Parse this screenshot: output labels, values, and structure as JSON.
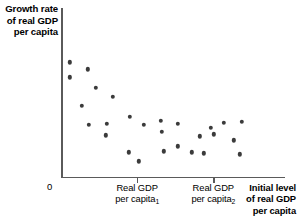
{
  "chart_data": {
    "type": "scatter",
    "title": "",
    "ylabel": "Growth rate of real GDP per capita",
    "xlabel": "Initial level of real GDP per capita",
    "grid": false,
    "legend": null,
    "origin_label": "0",
    "xlim": [
      0,
      1
    ],
    "ylim": [
      0,
      1
    ],
    "xticks": [
      {
        "value": 0.34,
        "label_line1": "Real GDP",
        "label_line2": "per capita",
        "label_sub": "1"
      },
      {
        "value": 0.68,
        "label_line1": "Real GDP",
        "label_line2": "per capita",
        "label_sub": "2"
      }
    ],
    "point_color": "#3b3b3b",
    "axis_color": "#5a5a5a",
    "points": [
      {
        "x": 0.0402,
        "y": 0.6784
      },
      {
        "x": 0.1205,
        "y": 0.6375
      },
      {
        "x": 0.0402,
        "y": 0.5906
      },
      {
        "x": 0.1563,
        "y": 0.5263
      },
      {
        "x": 0.2321,
        "y": 0.4737
      },
      {
        "x": 0.0938,
        "y": 0.4211
      },
      {
        "x": 0.308,
        "y": 0.3567
      },
      {
        "x": 0.2054,
        "y": 0.3158
      },
      {
        "x": 0.125,
        "y": 0.3099
      },
      {
        "x": 0.3705,
        "y": 0.3099
      },
      {
        "x": 0.2009,
        "y": 0.2456
      },
      {
        "x": 0.4464,
        "y": 0.3333
      },
      {
        "x": 0.4509,
        "y": 0.269
      },
      {
        "x": 0.3036,
        "y": 0.1462
      },
      {
        "x": 0.4598,
        "y": 0.152
      },
      {
        "x": 0.5223,
        "y": 0.1813
      },
      {
        "x": 0.5848,
        "y": 0.1462
      },
      {
        "x": 0.6205,
        "y": 0.2398
      },
      {
        "x": 0.5223,
        "y": 0.3158
      },
      {
        "x": 0.6696,
        "y": 0.2924
      },
      {
        "x": 0.7277,
        "y": 0.3216
      },
      {
        "x": 0.683,
        "y": 0.2515
      },
      {
        "x": 0.7723,
        "y": 0.2164
      },
      {
        "x": 0.6384,
        "y": 0.1404
      },
      {
        "x": 0.808,
        "y": 0.3275
      },
      {
        "x": 0.7991,
        "y": 0.1345
      },
      {
        "x": 0.3482,
        "y": 0.0936
      }
    ]
  }
}
